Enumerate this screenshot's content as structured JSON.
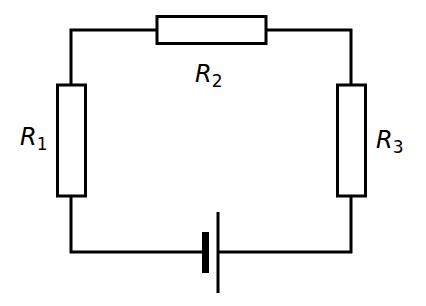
{
  "diagram": {
    "type": "circuit",
    "components": [
      {
        "id": "R1",
        "kind": "resistor",
        "label": "R",
        "subscript": "1",
        "orientation": "vertical",
        "position": "left"
      },
      {
        "id": "R2",
        "kind": "resistor",
        "label": "R",
        "subscript": "2",
        "orientation": "horizontal",
        "position": "top"
      },
      {
        "id": "R3",
        "kind": "resistor",
        "label": "R",
        "subscript": "3",
        "orientation": "vertical",
        "position": "right"
      },
      {
        "id": "cell",
        "kind": "battery-cell",
        "position": "bottom"
      }
    ],
    "connection": "series loop",
    "colors": {
      "stroke": "#000000",
      "background": "#ffffff"
    }
  }
}
